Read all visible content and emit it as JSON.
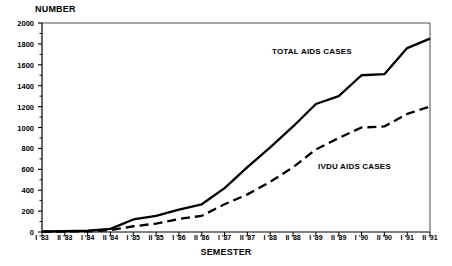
{
  "chart_data": {
    "type": "line",
    "title": "",
    "xlabel": "SEMESTER",
    "ylabel": "NUMBER",
    "ylim": [
      0,
      2000
    ],
    "ytick_step": 200,
    "minor_ticks": true,
    "grid": false,
    "legend_position": "inline-annotation",
    "categories": [
      "I '83",
      "II '83",
      "I '84",
      "II '84",
      "I '85",
      "II '85",
      "I '86",
      "II '86",
      "I '87",
      "II '87",
      "I '88",
      "II '88",
      "I '89",
      "II '89",
      "I '90",
      "II '90",
      "I '91",
      "II '91"
    ],
    "yticks": [
      0,
      200,
      400,
      600,
      800,
      1000,
      1200,
      1400,
      1600,
      1800,
      2000
    ],
    "series": [
      {
        "name": "TOTAL AIDS CASES",
        "style": "solid",
        "color": "#000000",
        "values": [
          5,
          8,
          12,
          30,
          120,
          155,
          215,
          265,
          420,
          620,
          810,
          1010,
          1225,
          1300,
          1500,
          1510,
          1760,
          1850
        ]
      },
      {
        "name": "IVDU AIDS CASES",
        "style": "dashed",
        "color": "#000000",
        "values": [
          3,
          5,
          7,
          18,
          55,
          80,
          125,
          155,
          265,
          360,
          480,
          620,
          790,
          900,
          1000,
          1010,
          1130,
          1200
        ]
      }
    ],
    "annotations": [
      {
        "text": "TOTAL AIDS CASES",
        "x_px": 272,
        "y_px": 47
      },
      {
        "text": "IVDU AIDS CASES",
        "x_px": 318,
        "y_px": 162
      }
    ]
  },
  "axes": {
    "y_title": "NUMBER",
    "x_title": "SEMESTER"
  }
}
